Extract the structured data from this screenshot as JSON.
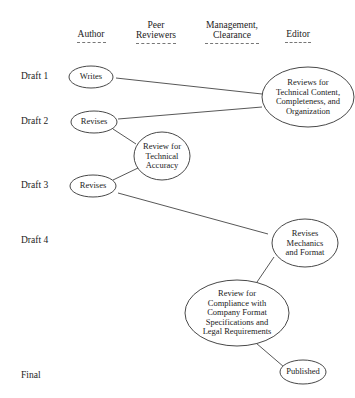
{
  "columns": [
    {
      "label": "Author",
      "x": 91
    },
    {
      "label": "Peer\nReviewers",
      "x": 156
    },
    {
      "label": "Management,\nClearance",
      "x": 232
    },
    {
      "label": "Editor",
      "x": 298
    }
  ],
  "column_labels": {
    "author": "Author",
    "peer_line1": "Peer",
    "peer_line2": "Reviewers",
    "mgmt_line1": "Management,",
    "mgmt_line2": "Clearance",
    "editor": "Editor"
  },
  "rows": {
    "draft1": "Draft 1",
    "draft2": "Draft 2",
    "draft3": "Draft 3",
    "draft4": "Draft 4",
    "final": "Final"
  },
  "nodes": {
    "writes": "Writes",
    "revises1": "Revises",
    "review_tech_acc": [
      "Review for",
      "Technical",
      "Accuracy"
    ],
    "revises2": "Revises",
    "editor_review": [
      "Reviews for",
      "Technical Content,",
      "Completeness, and",
      "Organization"
    ],
    "editor_revises": [
      "Revises",
      "Mechanics",
      "and Format"
    ],
    "compliance": [
      "Review for",
      "Compliance with",
      "Company Format",
      "Specifications and",
      "Legal Requirements"
    ],
    "published": "Published"
  }
}
